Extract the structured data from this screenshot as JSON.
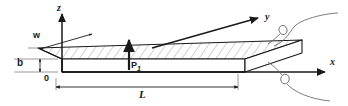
{
  "figure": {
    "kind": "engineering-diagram",
    "background_color": "#ffffff",
    "line_color": "#1a1a1a",
    "leader_color": "#6b6b6b",
    "hatch_color": "#8a8a8a"
  },
  "axes": {
    "z": {
      "label": "z",
      "direction": "up"
    },
    "y": {
      "label": "y",
      "direction": "up-right-depth"
    },
    "x": {
      "label": "x",
      "direction": "right"
    },
    "origin": {
      "label": "0"
    }
  },
  "dimensions": {
    "width": {
      "label": "w",
      "description": "plate width along y"
    },
    "thickness": {
      "label": "b",
      "description": "plate thickness along z"
    },
    "length": {
      "label": "L",
      "description": "plate length along x"
    }
  },
  "load": {
    "label": "P",
    "subscript": "1",
    "direction": "upward",
    "description": "point load applied at mid-span"
  },
  "callouts": [
    {
      "name": "upper-support-callout",
      "description": "curved leader with loop to top right edge"
    },
    {
      "name": "lower-support-callout",
      "description": "curved leader with loop below x axis"
    }
  ]
}
